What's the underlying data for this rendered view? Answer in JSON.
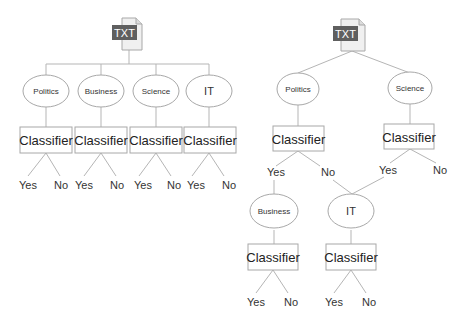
{
  "left_tree": {
    "root": {
      "icon": "txt-file-icon",
      "label": "TXT"
    },
    "categories": [
      {
        "label": "Politics",
        "classifier": "Classifier",
        "yes": "Yes",
        "no": "No"
      },
      {
        "label": "Business",
        "classifier": "Classifier",
        "yes": "Yes",
        "no": "No"
      },
      {
        "label": "Science",
        "classifier": "Classifier",
        "yes": "Yes",
        "no": "No"
      },
      {
        "label": "IT",
        "classifier": "Classifier",
        "yes": "Yes",
        "no": "No"
      }
    ]
  },
  "right_tree": {
    "root": {
      "icon": "txt-file-icon",
      "label": "TXT"
    },
    "politics": {
      "label": "Politics",
      "classifier": "Classifier",
      "yes": "Yes",
      "no": "No"
    },
    "science": {
      "label": "Science",
      "classifier": "Classifier",
      "yes": "Yes",
      "no": "No"
    },
    "business": {
      "label": "Business",
      "classifier": "Classifier",
      "yes": "Yes",
      "no": "No"
    },
    "it": {
      "label": "IT",
      "classifier": "Classifier",
      "yes": "Yes",
      "no": "No"
    }
  }
}
